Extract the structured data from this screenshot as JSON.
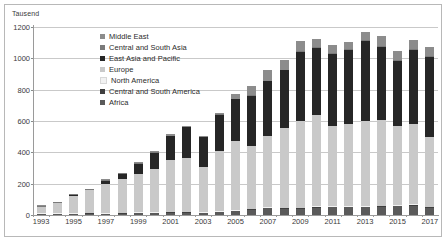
{
  "axis_unit_label": "Tausend",
  "legend": {
    "position": "inside-top-left",
    "items": [
      {
        "label": "Middle East",
        "color": "#8c8c8c"
      },
      {
        "label": "Central and South Asia",
        "color": "#7a7a7a"
      },
      {
        "label": "East Asia and Pacific",
        "color": "#262626"
      },
      {
        "label": "Europe",
        "color": "#c9c9c9"
      },
      {
        "label": "North America",
        "color": "#f2f2f2"
      },
      {
        "label": "Central and South America",
        "color": "#3f3f3f"
      },
      {
        "label": "Africa",
        "color": "#5a5a5a"
      }
    ]
  },
  "chart_data": {
    "type": "bar",
    "title": "",
    "subtitle": "",
    "xlabel": "",
    "ylabel": "Tausend",
    "stacked": true,
    "grid": true,
    "ylim": [
      0,
      1200
    ],
    "yticks": [
      0,
      200,
      400,
      600,
      800,
      1000,
      1200
    ],
    "ytick_labels": [
      "0",
      "200",
      "400",
      "600",
      "800",
      "1000",
      "1200"
    ],
    "categories": [
      "1993",
      "1994",
      "1995",
      "1996",
      "1997",
      "1998",
      "1999",
      "2000",
      "2001",
      "2002",
      "2003",
      "2004",
      "2005",
      "2006",
      "2007",
      "2008",
      "2009",
      "2010",
      "2011",
      "2012",
      "2013",
      "2014",
      "2015",
      "2016",
      "2017"
    ],
    "xtick_labels": [
      "1993",
      "1995",
      "1997",
      "1999",
      "2001",
      "2003",
      "2005",
      "2007",
      "2009",
      "2011",
      "2013",
      "2015",
      "2017"
    ],
    "series": [
      {
        "name": "Africa",
        "color": "#5a5a5a",
        "values": [
          3,
          4,
          5,
          7,
          5,
          8,
          10,
          11,
          13,
          14,
          10,
          17,
          25,
          32,
          42,
          40,
          40,
          47,
          48,
          49,
          50,
          52,
          56,
          60,
          46
        ]
      },
      {
        "name": "Central and South America",
        "color": "#3f3f3f",
        "values": [
          1,
          1,
          1,
          1,
          1,
          1,
          1,
          1,
          1,
          1,
          1,
          1,
          1,
          1,
          1,
          1,
          1,
          1,
          1,
          1,
          1,
          1,
          1,
          1,
          1
        ]
      },
      {
        "name": "North America",
        "color": "#f2f2f2",
        "values": [
          1,
          1,
          1,
          1,
          1,
          1,
          1,
          1,
          1,
          1,
          1,
          1,
          1,
          1,
          1,
          1,
          1,
          1,
          1,
          1,
          1,
          1,
          1,
          1,
          1
        ]
      },
      {
        "name": "Europe",
        "color": "#c9c9c9",
        "values": [
          38,
          62,
          110,
          143,
          183,
          213,
          246,
          273,
          330,
          342,
          288,
          382,
          440,
          402,
          452,
          510,
          553,
          583,
          512,
          525,
          545,
          545,
          503,
          512,
          446
        ]
      },
      {
        "name": "East Asia and Pacific",
        "color": "#262626",
        "values": [
          3,
          4,
          6,
          4,
          24,
          34,
          65,
          105,
          153,
          196,
          190,
          233,
          266,
          318,
          351,
          366,
          443,
          429,
          461,
          471,
          510,
          468,
          418,
          472,
          509
        ]
      },
      {
        "name": "Central and South Asia",
        "color": "#7a7a7a",
        "values": [
          1,
          1,
          1,
          1,
          1,
          1,
          1,
          1,
          1,
          1,
          1,
          1,
          3,
          5,
          6,
          5,
          5,
          6,
          6,
          6,
          6,
          6,
          6,
          6,
          6
        ]
      },
      {
        "name": "Middle East",
        "color": "#8c8c8c",
        "values": [
          2,
          2,
          3,
          3,
          4,
          4,
          4,
          6,
          7,
          8,
          7,
          9,
          32,
          56,
          66,
          60,
          65,
          50,
          50,
          48,
          52,
          64,
          58,
          61,
          61
        ]
      }
    ]
  }
}
